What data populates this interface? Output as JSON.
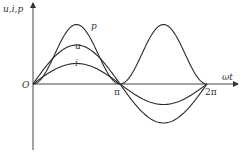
{
  "chart_data": {
    "type": "line",
    "title": "",
    "xlabel": "ωt",
    "ylabel": "u,i,p",
    "origin_label": "O",
    "x_ticks": [
      {
        "value": 3.14159,
        "label": "π"
      },
      {
        "value": 6.28318,
        "label": "2π"
      }
    ],
    "xlim": [
      0,
      7.2
    ],
    "ylim": [
      -1.6,
      1.6
    ],
    "series": [
      {
        "name": "p",
        "formula": "p = 1.5·(1 - cos 2ωt)/2 ·... instantaneous power",
        "amplitude": 1.45,
        "kind": "power"
      },
      {
        "name": "u",
        "amplitude": 0.95,
        "kind": "sine"
      },
      {
        "name": "i",
        "amplitude": 0.5,
        "kind": "sine"
      }
    ]
  }
}
